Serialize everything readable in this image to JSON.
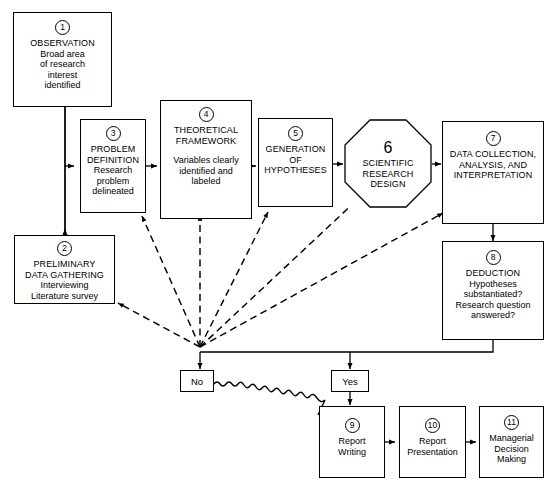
{
  "diagram": {
    "nodes": [
      {
        "id": "n1",
        "number": "1",
        "shape": "rect",
        "title": "OBSERVATION",
        "lines": [
          "Broad area",
          "of research",
          "interest",
          "identified"
        ]
      },
      {
        "id": "n2",
        "number": "2",
        "shape": "rect",
        "title": "PRELIMINARY",
        "title2": "DATA GATHERING",
        "lines": [
          "Interviewing",
          "Literature survey"
        ]
      },
      {
        "id": "n3",
        "number": "3",
        "shape": "rect",
        "title": "PROBLEM",
        "title2": "DEFINITION",
        "lines": [
          "Research",
          "problem",
          "delineated"
        ]
      },
      {
        "id": "n4",
        "number": "4",
        "shape": "rect",
        "title": "THEORETICAL",
        "title2": "FRAMEWORK",
        "lines": [
          "Variables clearly",
          "identified and",
          "labeled"
        ]
      },
      {
        "id": "n5",
        "number": "5",
        "shape": "rect",
        "title": "GENERATION",
        "title2": "OF",
        "title3": "HYPOTHESES"
      },
      {
        "id": "n6",
        "number": "6",
        "shape": "octagon",
        "title": "SCIENTIFIC",
        "title2": "RESEARCH",
        "title3": "DESIGN"
      },
      {
        "id": "n7",
        "number": "7",
        "shape": "rect",
        "title": "DATA COLLECTION,",
        "title2": "ANALYSIS, AND",
        "title3": "INTERPRETATION"
      },
      {
        "id": "n8",
        "number": "8",
        "shape": "rect",
        "title": "DEDUCTION",
        "lines": [
          "Hypotheses",
          "substantiated?",
          "Research question",
          "answered?"
        ]
      },
      {
        "id": "n9",
        "number": "9",
        "shape": "rect",
        "lines": [
          "Report",
          "Writing"
        ]
      },
      {
        "id": "n10",
        "number": "10",
        "shape": "rect",
        "lines": [
          "Report",
          "Presentation"
        ]
      },
      {
        "id": "n11",
        "number": "11",
        "shape": "rect",
        "lines": [
          "Managerial",
          "Decision",
          "Making"
        ]
      }
    ],
    "decision_labels": {
      "no": "No",
      "yes": "Yes"
    },
    "colors": {
      "line": "#000000",
      "fill": "#ffffff"
    }
  }
}
